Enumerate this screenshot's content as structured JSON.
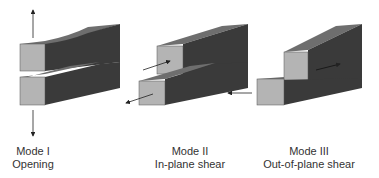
{
  "modes": [
    {
      "title": "Mode I",
      "subtitle": "Opening"
    },
    {
      "title": "Mode II",
      "subtitle": "In-plane shear"
    },
    {
      "title": "Mode III",
      "subtitle": "Out-of-plane shear"
    }
  ],
  "colors": {
    "front_face": "#b4b4b4",
    "top_face": "#6e6e6e",
    "side_face": "#3a3a3a",
    "arrow": "#222222",
    "text": "#333333"
  }
}
